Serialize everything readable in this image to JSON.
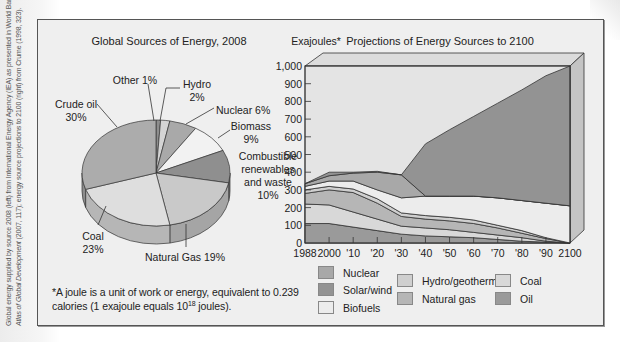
{
  "side_credit": {
    "line1": "Global energy supplied by source 2008 (left) from International Energy Agency (IEA) as presented in World Bank,",
    "line2_italic": "Atlas of Global Development",
    "line2_rest": " (2007, 117); energy source projections to 2100 (right) from Crume (1998, 323)."
  },
  "footnote": {
    "text_before": "*A joule is a unit of work or energy, equivalent to 0.239 calories (1 exajoule equals 10",
    "superscript": "18",
    "text_after": " joules)."
  },
  "chart_data": [
    {
      "type": "pie",
      "title": "Global Sources of Energy, 2008",
      "categories": [
        "Other",
        "Hydro",
        "Nuclear",
        "Biomass",
        "Combustible renewables and waste",
        "Natural Gas",
        "Coal",
        "Crude oil"
      ],
      "values": [
        1,
        2,
        6,
        9,
        10,
        19,
        23,
        30
      ],
      "unit": "%",
      "labels": [
        {
          "lines": [
            "Other 1%"
          ]
        },
        {
          "lines": [
            "Hydro",
            "2%"
          ]
        },
        {
          "lines": [
            "Nuclear 6%"
          ]
        },
        {
          "lines": [
            "Biomass",
            "9%"
          ]
        },
        {
          "lines": [
            "Combustible",
            "renewables",
            "and waste",
            "10%"
          ]
        },
        {
          "lines": [
            "Natural Gas 19%"
          ]
        },
        {
          "lines": [
            "Coal",
            "23%"
          ]
        },
        {
          "lines": [
            "Crude oil",
            "30%"
          ]
        }
      ],
      "colors": [
        "#8e8e8e",
        "#d4d4d4",
        "#a9a9a9",
        "#f2f2f2",
        "#8f8f8f",
        "#c9c9c9",
        "#dedede",
        "#acacac"
      ],
      "style": "3d"
    },
    {
      "type": "area",
      "stacked": true,
      "title": "Projections of Energy Sources to 2100",
      "ylabel": "Exajoules*",
      "xlabel": "",
      "ylim": [
        0,
        1000
      ],
      "yticks": [
        "0",
        "100",
        "200",
        "300",
        "400",
        "500",
        "600",
        "700",
        "800",
        "900",
        "1,000"
      ],
      "x": [
        1988,
        2000,
        2010,
        2020,
        2030,
        2040,
        2050,
        2060,
        2070,
        2080,
        2090,
        2100
      ],
      "xtick_labels": [
        "1988",
        "2000",
        "'10",
        "'20",
        "'30",
        "'40",
        "'50",
        "'60",
        "'70",
        "'80",
        "'90",
        "2100"
      ],
      "grid": false,
      "legend_position": "bottom",
      "series": [
        {
          "name": "Oil",
          "color": "#9a9a9a",
          "values": [
            110,
            110,
            90,
            70,
            50,
            40,
            35,
            30,
            20,
            10,
            5,
            0
          ]
        },
        {
          "name": "Coal",
          "color": "#d8d8d8",
          "values": [
            110,
            105,
            85,
            65,
            45,
            45,
            40,
            30,
            25,
            20,
            5,
            0
          ]
        },
        {
          "name": "Natural gas",
          "color": "#b6b6b6",
          "values": [
            60,
            85,
            110,
            90,
            55,
            50,
            50,
            50,
            40,
            25,
            15,
            0
          ]
        },
        {
          "name": "Hydro/geothermal",
          "color": "#cfcfcf",
          "values": [
            20,
            20,
            20,
            25,
            20,
            20,
            20,
            20,
            15,
            15,
            5,
            0
          ]
        },
        {
          "name": "Biofuels",
          "color": "#ececec",
          "values": [
            20,
            30,
            45,
            50,
            85,
            110,
            120,
            135,
            155,
            170,
            195,
            210
          ]
        },
        {
          "name": "Nuclear",
          "color": "#a8a8a8",
          "values": [
            15,
            30,
            45,
            100,
            130,
            0,
            0,
            0,
            0,
            0,
            0,
            0
          ]
        },
        {
          "name": "Solar/wind",
          "color": "#939393",
          "values": [
            0,
            20,
            5,
            5,
            0,
            295,
            375,
            450,
            535,
            625,
            720,
            790
          ]
        }
      ],
      "remaining_area_color": "#e4e4e4",
      "legend": [
        {
          "label": "Nuclear",
          "color": "#a8a8a8"
        },
        {
          "label": "Solar/wind",
          "color": "#939393"
        },
        {
          "label": "Biofuels",
          "color": "#ececec"
        },
        {
          "label": "Hydro/geothermal",
          "color": "#cfcfcf"
        },
        {
          "label": "Natural gas",
          "color": "#b6b6b6"
        },
        {
          "label": "Coal",
          "color": "#d8d8d8"
        },
        {
          "label": "Oil",
          "color": "#9a9a9a"
        }
      ]
    }
  ]
}
